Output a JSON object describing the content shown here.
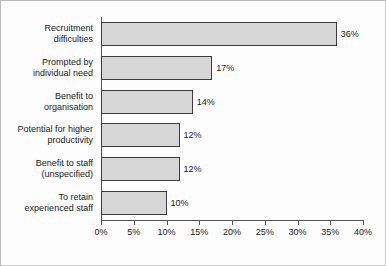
{
  "chart_data": {
    "type": "bar",
    "orientation": "horizontal",
    "title": "",
    "subtitle": "",
    "xlabel": "",
    "ylabel": "",
    "xlim": [
      0,
      40
    ],
    "grid": false,
    "legend": "none",
    "categories": [
      "Recruitment\ndifficulties",
      "Prompted by\nindividual need",
      "Benefit to\norganisation",
      "Potential for higher\nproductivity",
      "Benefit to staff\n(unspecified)",
      "To retain\nexperienced staff"
    ],
    "values": [
      36,
      17,
      14,
      12,
      12,
      10
    ],
    "data_labels": [
      "36%",
      "17%",
      "14%",
      "12%",
      "12%",
      "10%"
    ],
    "x_ticks": [
      0,
      5,
      10,
      15,
      20,
      25,
      30,
      35,
      40
    ],
    "x_tick_labels": [
      "0%",
      "5%",
      "10%",
      "15%",
      "20%",
      "25%",
      "30%",
      "35%",
      "40%"
    ],
    "colors": {
      "bar_fill": "#d7d7d7",
      "bar_border": "#3c3c3c",
      "axis": "#555555",
      "text": "#1a1a1a",
      "frame": "#b8b8b8",
      "background": "#fdfdfd"
    }
  }
}
